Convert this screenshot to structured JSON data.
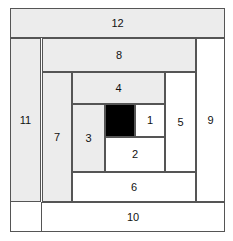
{
  "figure": {
    "width": 233,
    "height": 241,
    "background": "#ffffff"
  },
  "palette": {
    "light": "#ececec",
    "white": "#ffffff",
    "dark": "#000000",
    "outline": "#555555",
    "label_color": "#111111"
  },
  "frame": {
    "x": 10,
    "y": 8,
    "width": 215,
    "height": 224
  },
  "pieces": [
    {
      "label": "",
      "name": "center-square",
      "fill": "dark",
      "x": 105,
      "y": 104,
      "width": 30,
      "height": 33
    },
    {
      "label": "1",
      "name": "strip-1",
      "fill": "white",
      "x": 135,
      "y": 104,
      "width": 30,
      "height": 33
    },
    {
      "label": "2",
      "name": "strip-2",
      "fill": "white",
      "x": 105,
      "y": 137,
      "width": 60,
      "height": 35
    },
    {
      "label": "3",
      "name": "strip-3",
      "fill": "light",
      "x": 72,
      "y": 104,
      "width": 33,
      "height": 68
    },
    {
      "label": "4",
      "name": "strip-4",
      "fill": "light",
      "x": 72,
      "y": 72,
      "width": 93,
      "height": 32
    },
    {
      "label": "5",
      "name": "strip-5",
      "fill": "white",
      "x": 165,
      "y": 72,
      "width": 31,
      "height": 100
    },
    {
      "label": "6",
      "name": "strip-6",
      "fill": "white",
      "x": 72,
      "y": 172,
      "width": 124,
      "height": 30
    },
    {
      "label": "7",
      "name": "strip-7",
      "fill": "light",
      "x": 42,
      "y": 72,
      "width": 30,
      "height": 130
    },
    {
      "label": "8",
      "name": "strip-8",
      "fill": "light",
      "x": 42,
      "y": 38,
      "width": 154,
      "height": 34
    },
    {
      "label": "9",
      "name": "strip-9",
      "fill": "white",
      "x": 196,
      "y": 38,
      "width": 29,
      "height": 164
    },
    {
      "label": "10",
      "name": "strip-10",
      "fill": "white",
      "x": 41,
      "y": 202,
      "width": 184,
      "height": 30
    },
    {
      "label": "11",
      "name": "strip-11",
      "fill": "light",
      "x": 10,
      "y": 38,
      "width": 31,
      "height": 164
    },
    {
      "label": "12",
      "name": "strip-12",
      "fill": "light",
      "x": 10,
      "y": 8,
      "width": 215,
      "height": 30
    }
  ]
}
